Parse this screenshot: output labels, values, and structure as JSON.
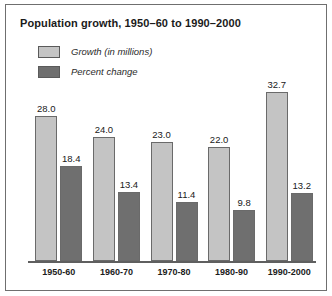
{
  "chart_data": {
    "type": "bar",
    "title": "Population growth, 1950–60 to 1990–2000",
    "xlabel": "",
    "ylabel": "",
    "grid": false,
    "legend_position": "top-left",
    "categories": [
      "1950-60",
      "1960-70",
      "1970-80",
      "1980-90",
      "1990-2000"
    ],
    "series": [
      {
        "name": "Growth (in millions)",
        "color": "#c4c4c4",
        "values": [
          28.0,
          24.0,
          23.0,
          22.0,
          32.7
        ],
        "labels": [
          "28.0",
          "24.0",
          "23.0",
          "22.0",
          "32.7"
        ]
      },
      {
        "name": "Percent change",
        "color": "#6f6f6f",
        "values": [
          18.4,
          13.4,
          11.4,
          9.8,
          13.2
        ],
        "labels": [
          "18.4",
          "13.4",
          "11.4",
          "9.8",
          "13.2"
        ]
      }
    ],
    "ylim": [
      0,
      34
    ]
  },
  "legend": {
    "items": [
      {
        "label": "Growth (in millions)",
        "swatch": "#c4c4c4"
      },
      {
        "label": "Percent change",
        "swatch": "#6f6f6f"
      }
    ]
  },
  "colors": {
    "growth": "#c4c4c4",
    "percent": "#6f6f6f",
    "axis": "#5f5f5f",
    "frame": "#6f6f6f",
    "text": "#1a1a1a"
  }
}
